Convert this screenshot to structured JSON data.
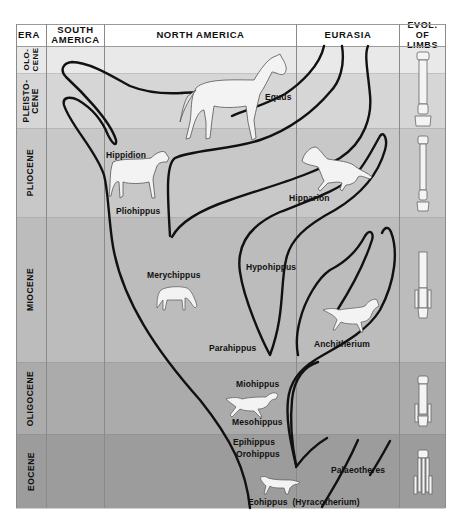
{
  "headers": {
    "era": "ERA",
    "south_america": "SOUTH\nAMERICA",
    "north_america": "NORTH AMERICA",
    "eurasia": "EURASIA",
    "limbs": "EVOL. OF\nLIMBS"
  },
  "epochs": [
    {
      "id": "holocene",
      "label": "OLO-\nCENE",
      "color": "#e9e9e9"
    },
    {
      "id": "pleistocene",
      "label": "PLEISTO-\nCENE",
      "color": "#d7d7d7"
    },
    {
      "id": "pliocene",
      "label": "PLIOCENE",
      "color": "#c9c9c9"
    },
    {
      "id": "miocene",
      "label": "MIOCENE",
      "color": "#bdbdbd"
    },
    {
      "id": "oligocene",
      "label": "OLIGOCENE",
      "color": "#acacac"
    },
    {
      "id": "eocene",
      "label": "EOCENE",
      "color": "#9d9d9d"
    }
  ],
  "taxa": {
    "equus": "Equus",
    "hippidion": "Hippidion",
    "pliohippus": "Pliohippus",
    "hipparion": "Hipparion",
    "merychippus": "Merychippus",
    "hypohippus": "Hypohippus",
    "parahippus": "Parahippus",
    "anchitherium": "Anchitherium",
    "miohippus": "Miohippus",
    "mesohippus": "Mesohippus",
    "epihippus": "Epihippus",
    "orohippus": "Orohippus",
    "palaeotheres": "Palaeotheres",
    "eohippus": "Eohippus  (Hyracotherium)"
  },
  "colors": {
    "line": "#111111",
    "grid": "#8a8a8a",
    "horse": "#f2f2f2"
  }
}
